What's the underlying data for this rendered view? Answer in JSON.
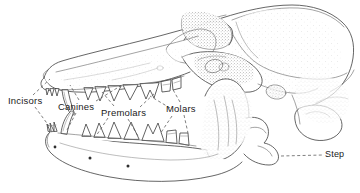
{
  "figure": {
    "background_color": "#ffffff",
    "ink_color": "#3c3c3c",
    "label_color": "#1a1a1a"
  },
  "labels": {
    "incisors": "Incisors",
    "canines": "Canines",
    "premolars": "Premolars",
    "molars": "Molars",
    "step": "Step"
  },
  "annotations": [
    {
      "id": "incisors",
      "text": "Incisors",
      "leader_style": "dashed",
      "leader_count": 2,
      "points_to": "incisor teeth, upper and lower front"
    },
    {
      "id": "canines",
      "text": "Canines",
      "leader_style": "dashed",
      "leader_count": 2,
      "points_to": "upper and lower canine teeth"
    },
    {
      "id": "premolars",
      "text": "Premolars",
      "leader_style": "dashed",
      "leader_count": 2,
      "points_to": "upper and lower premolar rows"
    },
    {
      "id": "molars",
      "text": "Molars",
      "leader_style": "dashed",
      "leader_count": 2,
      "points_to": "upper and lower molar teeth"
    },
    {
      "id": "step",
      "text": "Step",
      "leader_style": "dashed",
      "leader_count": 1,
      "points_to": "angular process step of the mandible"
    }
  ],
  "anatomy_parts": [
    "cranium",
    "braincase",
    "sagittal-crest",
    "temporal-fossa",
    "zygomatic-arch",
    "orbit",
    "nasal-bone",
    "maxilla",
    "premaxilla",
    "mandible",
    "coronoid-process",
    "condylar-process",
    "angular-process",
    "occipital-condyle",
    "auditory-bulla",
    "mental-foramina"
  ]
}
